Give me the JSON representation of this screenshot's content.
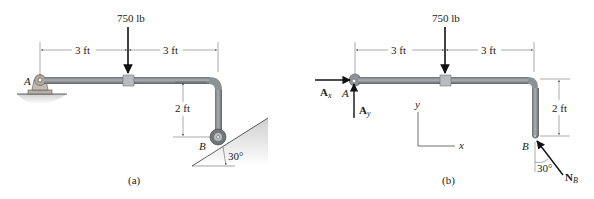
{
  "figure_a": {
    "caption": "(a)",
    "load": "750 lb",
    "dim_left": "3 ft",
    "dim_right": "3 ft",
    "dim_vertical": "2 ft",
    "point_a": "A",
    "point_b": "B",
    "angle": "30°"
  },
  "figure_b": {
    "caption": "(b)",
    "load": "750 lb",
    "dim_left": "3 ft",
    "dim_right": "3 ft",
    "dim_vertical": "2 ft",
    "point_a": "A",
    "point_b": "B",
    "angle": "30°",
    "force_ax": "A",
    "force_ax_sub": "x",
    "force_ay": "A",
    "force_ay_sub": "y",
    "force_nb": "N",
    "force_nb_sub": "B",
    "axis_x": "x",
    "axis_y": "y"
  },
  "colors": {
    "pipe": "#8a9296",
    "pipe_dark": "#5f676b",
    "support": "#b8b0a4",
    "ground": "#d9d9d9",
    "line": "#1a1a1a"
  }
}
